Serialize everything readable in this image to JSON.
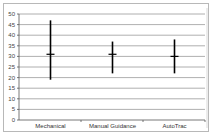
{
  "chart_data": {
    "type": "high-low-close",
    "title": "",
    "xlabel": "",
    "ylabel": "",
    "categories": [
      "Mechanical",
      "Manual Guidance",
      "AutoTrac"
    ],
    "series": [
      {
        "name": "High",
        "values": [
          47,
          37,
          38
        ]
      },
      {
        "name": "Low",
        "values": [
          19,
          22,
          22
        ]
      },
      {
        "name": "Mean",
        "values": [
          31,
          31,
          30
        ]
      }
    ],
    "yticks": [
      0,
      5,
      10,
      15,
      20,
      25,
      30,
      35,
      40,
      45,
      50
    ],
    "ylim": [
      0,
      50
    ],
    "grid": true,
    "legend": "none"
  },
  "colors": {
    "gridline": "#9a9a9a",
    "bar": "#000000",
    "frame": "#b8b8b8"
  }
}
